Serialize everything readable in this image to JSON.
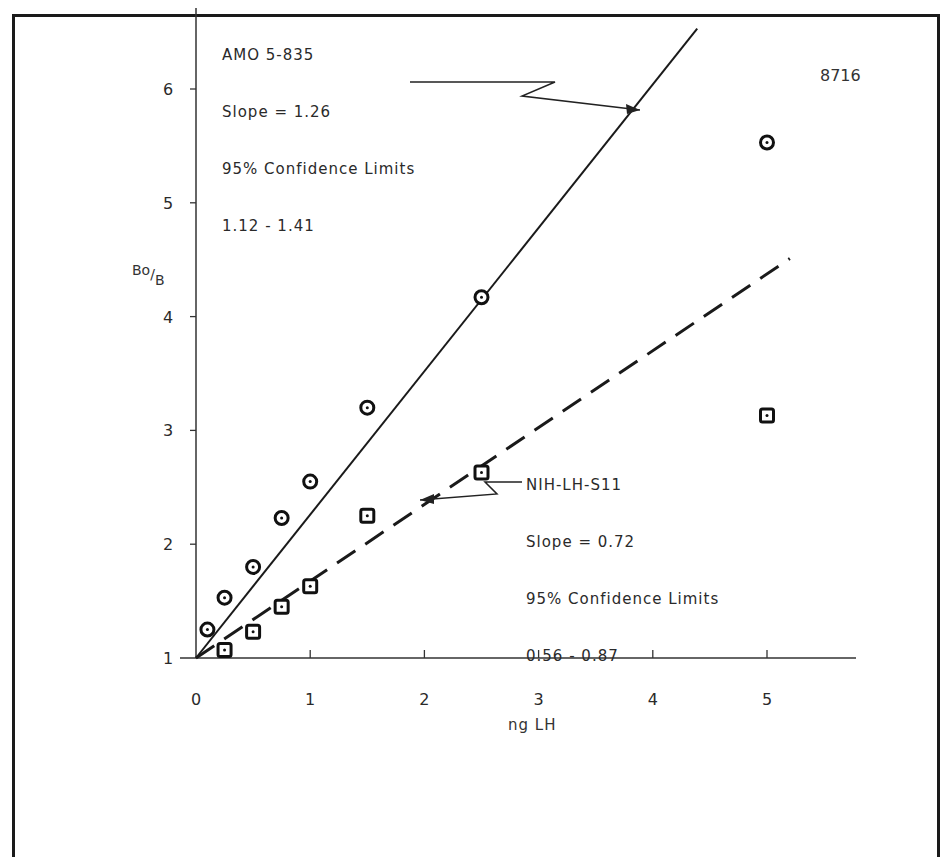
{
  "chart_data": {
    "type": "scatter",
    "title": "",
    "corner_label": "8716",
    "xlabel": "ng LH",
    "ylabel": "Bo/B",
    "ylabel_num": "Bo",
    "ylabel_den": "B",
    "xlim": [
      0,
      5.6
    ],
    "ylim": [
      1,
      6.5
    ],
    "x_ticks": [
      0,
      1,
      2,
      3,
      4,
      5
    ],
    "y_ticks": [
      1,
      2,
      3,
      4,
      5,
      6
    ],
    "grid": false,
    "series": [
      {
        "name": "AMO 5-835",
        "marker": "circle",
        "line_style": "solid",
        "slope": 1.26,
        "confidence_limits": "1.12 - 1.41",
        "x": [
          0.1,
          0.25,
          0.5,
          0.75,
          1.0,
          1.5,
          2.5,
          5.0
        ],
        "y": [
          1.25,
          1.53,
          1.8,
          2.23,
          2.55,
          3.2,
          4.17,
          5.53
        ]
      },
      {
        "name": "NIH-LH-S11",
        "marker": "square",
        "line_style": "dashed",
        "slope": 0.72,
        "confidence_limits": "0.56 - 0.87",
        "x": [
          0.25,
          0.5,
          0.75,
          1.0,
          1.5,
          2.5,
          5.0
        ],
        "y": [
          1.07,
          1.23,
          1.45,
          1.63,
          2.25,
          2.63,
          3.13
        ]
      }
    ]
  },
  "annotations": {
    "amo": {
      "line1": "AMO 5-835",
      "line2": "Slope = 1.26",
      "line3": "95% Confidence Limits",
      "line4": "1.12 - 1.41"
    },
    "nih": {
      "line1": "NIH-LH-S11",
      "line2": "Slope = 0.72",
      "line3": "95% Confidence Limits",
      "line4": "0.56 - 0.87"
    }
  },
  "axis_labels": {
    "x_ticks": [
      "0",
      "1",
      "2",
      "3",
      "4",
      "5"
    ],
    "y_ticks": [
      "1",
      "2",
      "3",
      "4",
      "5",
      "6"
    ]
  }
}
